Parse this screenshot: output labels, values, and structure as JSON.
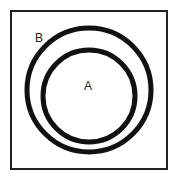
{
  "diagram": {
    "type": "venn-subset",
    "universe": {
      "shape": "square",
      "x": 11,
      "y": 11,
      "width": 156,
      "height": 158,
      "stroke": "#222222",
      "stroke_width": 2
    },
    "sets": [
      {
        "id": "B",
        "label": "B",
        "cx": 89,
        "cy": 90,
        "r": 62,
        "stroke": "#111111",
        "stroke_width": 5
      },
      {
        "id": "A",
        "label": "A",
        "cx": 89,
        "cy": 96,
        "r": 46,
        "stroke": "#111111",
        "stroke_width": 5
      }
    ],
    "labels": {
      "a": "A",
      "b": "B"
    },
    "relationship": "A ⊂ B"
  }
}
